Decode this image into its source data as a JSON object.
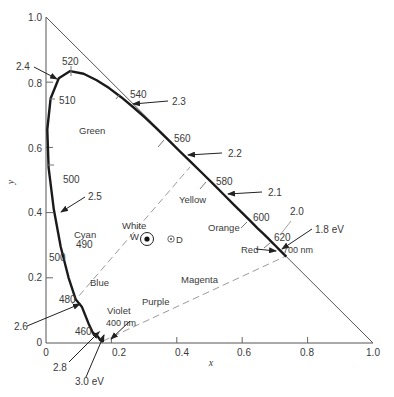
{
  "chart_data": {
    "type": "line",
    "title": "",
    "xlabel": "x",
    "ylabel": "y",
    "xlim": [
      0,
      1.0
    ],
    "ylim": [
      0,
      1.0
    ],
    "grid": false,
    "legend": "none",
    "x_ticks": [
      {
        "v": 0,
        "label": "0"
      },
      {
        "v": 0.2,
        "label": "0.2"
      },
      {
        "v": 0.4,
        "label": "0.4"
      },
      {
        "v": 0.6,
        "label": "0.6"
      },
      {
        "v": 0.8,
        "label": "0.8"
      },
      {
        "v": 1.0,
        "label": "1.0"
      }
    ],
    "y_ticks": [
      {
        "v": 0,
        "label": "0"
      },
      {
        "v": 0.2,
        "label": "0.2"
      },
      {
        "v": 0.4,
        "label": "0.4"
      },
      {
        "v": 0.6,
        "label": "0.6"
      },
      {
        "v": 0.8,
        "label": "0.8"
      },
      {
        "v": 1.0,
        "label": "1.0"
      }
    ],
    "series": [
      {
        "name": "spectral locus",
        "points": [
          [
            0.175,
            0.005
          ],
          [
            0.172,
            0.005
          ],
          [
            0.166,
            0.009
          ],
          [
            0.155,
            0.025
          ],
          [
            0.144,
            0.03
          ],
          [
            0.13,
            0.06
          ],
          [
            0.11,
            0.11
          ],
          [
            0.091,
            0.133
          ],
          [
            0.069,
            0.2
          ],
          [
            0.045,
            0.295
          ],
          [
            0.024,
            0.41
          ],
          [
            0.008,
            0.538
          ],
          [
            0.004,
            0.655
          ],
          [
            0.014,
            0.75
          ],
          [
            0.039,
            0.812
          ],
          [
            0.074,
            0.834
          ],
          [
            0.115,
            0.826
          ],
          [
            0.155,
            0.806
          ],
          [
            0.193,
            0.782
          ],
          [
            0.23,
            0.754
          ],
          [
            0.266,
            0.724
          ],
          [
            0.302,
            0.692
          ],
          [
            0.337,
            0.659
          ],
          [
            0.373,
            0.624
          ],
          [
            0.408,
            0.589
          ],
          [
            0.444,
            0.554
          ],
          [
            0.479,
            0.52
          ],
          [
            0.512,
            0.487
          ],
          [
            0.545,
            0.454
          ],
          [
            0.575,
            0.424
          ],
          [
            0.603,
            0.396
          ],
          [
            0.627,
            0.372
          ],
          [
            0.648,
            0.351
          ],
          [
            0.666,
            0.334
          ],
          [
            0.68,
            0.32
          ],
          [
            0.691,
            0.309
          ],
          [
            0.701,
            0.299
          ],
          [
            0.714,
            0.286
          ],
          [
            0.735,
            0.265
          ]
        ]
      },
      {
        "name": "x + y = 1 boundary",
        "points": [
          [
            0,
            1.0
          ],
          [
            1.0,
            0
          ]
        ]
      },
      {
        "name": "purple line (dashed)",
        "points": [
          [
            0.175,
            0.005
          ],
          [
            0.735,
            0.265
          ]
        ]
      },
      {
        "name": "complementary line (dashed)",
        "points": [
          [
            0.08,
            0.12
          ],
          [
            0.44,
            0.54
          ]
        ]
      }
    ],
    "wavelength_ticks_nm": [
      {
        "nm": 400,
        "x": 0.175,
        "y": 0.005,
        "label": "400 nm"
      },
      {
        "nm": 460,
        "x": 0.144,
        "y": 0.03,
        "label": "460"
      },
      {
        "nm": 480,
        "x": 0.091,
        "y": 0.133,
        "label": "480"
      },
      {
        "nm": 490,
        "x": 0.045,
        "y": 0.295,
        "label": "490"
      },
      {
        "nm": 500,
        "x": 0.008,
        "y": 0.538,
        "label": "500"
      },
      {
        "nm": 510,
        "x": 0.014,
        "y": 0.75,
        "label": "510"
      },
      {
        "nm": 520,
        "x": 0.074,
        "y": 0.834,
        "label": "520"
      },
      {
        "nm": 540,
        "x": 0.23,
        "y": 0.754,
        "label": "540"
      },
      {
        "nm": 560,
        "x": 0.373,
        "y": 0.624,
        "label": "560"
      },
      {
        "nm": 580,
        "x": 0.512,
        "y": 0.487,
        "label": "580"
      },
      {
        "nm": 600,
        "x": 0.627,
        "y": 0.372,
        "label": "600"
      },
      {
        "nm": 620,
        "x": 0.691,
        "y": 0.309,
        "label": "620"
      },
      {
        "nm": 700,
        "x": 0.735,
        "y": 0.265,
        "label": "700 nm"
      }
    ],
    "photon_energy_eV": [
      {
        "label": "3.0 eV",
        "x": 0.17,
        "y": 0.005
      },
      {
        "label": "2.8",
        "x": 0.15,
        "y": 0.025
      },
      {
        "label": "2.6",
        "x": 0.091,
        "y": 0.133
      },
      {
        "label": "2.5",
        "x": 0.024,
        "y": 0.41
      },
      {
        "label": "2.4",
        "x": 0.03,
        "y": 0.8
      },
      {
        "label": "2.3",
        "x": 0.237,
        "y": 0.748
      },
      {
        "label": "2.2",
        "x": 0.425,
        "y": 0.575
      },
      {
        "label": "2.1",
        "x": 0.57,
        "y": 0.432
      },
      {
        "label": "2.0",
        "x": 0.66,
        "y": 0.34
      },
      {
        "label": "1.8 eV",
        "x": 0.735,
        "y": 0.265
      }
    ],
    "points": [
      {
        "name": "White",
        "symbol": "W",
        "x": 0.31,
        "y": 0.316
      },
      {
        "name": "D",
        "symbol": "D",
        "x": 0.38,
        "y": 0.316
      }
    ],
    "annotations": [
      "Green",
      "Yellow",
      "Orange",
      "Red",
      "Magenta",
      "Purple",
      "Violet",
      "Blue",
      "Cyan",
      "White"
    ]
  },
  "labels": {
    "x_axis": "x",
    "y_axis": "y",
    "regions": {
      "green": "Green",
      "yellow": "Yellow",
      "orange": "Orange",
      "red": "Red",
      "magenta": "Magenta",
      "purple": "Purple",
      "violet": "Violet",
      "blue": "Blue",
      "cyan": "Cyan",
      "white": "White",
      "w": "W",
      "d": "D"
    },
    "wavelengths": {
      "w400": "400 nm",
      "w460": "460",
      "w480": "480",
      "w490": "490",
      "w500a": "500",
      "w500b": "500",
      "w510": "510",
      "w520": "520",
      "w540": "540",
      "w560": "560",
      "w580": "580",
      "w600": "600",
      "w620": "620",
      "w700": "700 nm"
    },
    "energies": {
      "e30": "3.0 eV",
      "e28": "2.8",
      "e26": "2.6",
      "e25": "2.5",
      "e24": "2.4",
      "e23": "2.3",
      "e22": "2.2",
      "e21": "2.1",
      "e20": "2.0",
      "e18": "1.8 eV"
    },
    "ticks": {
      "x0": "0",
      "x02": "0.2",
      "x04": "0.4",
      "x06": "0.6",
      "x08": "0.8",
      "x10": "1.0",
      "y0": "0",
      "y02": "0.2",
      "y04": "0.4",
      "y06": "0.6",
      "y08": "0.8",
      "y10": "1.0"
    }
  },
  "colors": {
    "locus": "#1a1a1a",
    "axis": "#555555",
    "dashed": "#9a9a9a",
    "text": "#3a3a3a"
  }
}
